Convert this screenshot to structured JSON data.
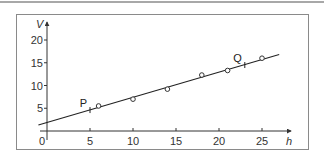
{
  "chart_data": {
    "type": "scatter",
    "title": "",
    "xlabel": "h",
    "ylabel": "V",
    "xlim": [
      0,
      27
    ],
    "ylim": [
      0,
      21
    ],
    "grid": false,
    "legend": null,
    "x_ticks": [
      0,
      5,
      10,
      15,
      20,
      25
    ],
    "x_tick_labels": [
      "0",
      "5",
      "10",
      "15",
      "20",
      "25"
    ],
    "y_ticks": [
      5,
      10,
      15,
      20
    ],
    "y_tick_labels": [
      "5",
      "10",
      "15",
      "20"
    ],
    "series": [
      {
        "name": "measurements",
        "marker": "open-circle",
        "x": [
          6,
          10,
          14,
          18,
          21,
          25
        ],
        "y": [
          5.5,
          7.0,
          9.2,
          12.3,
          13.3,
          16.0
        ]
      }
    ],
    "best_fit_line": {
      "x": [
        -1,
        27
      ],
      "y": [
        1.3,
        16.8
      ]
    },
    "annotations": [
      {
        "label": "P",
        "x": 5,
        "y": 4.6
      },
      {
        "label": "Q",
        "x": 23,
        "y": 14.5
      }
    ],
    "origin_label": "0"
  }
}
